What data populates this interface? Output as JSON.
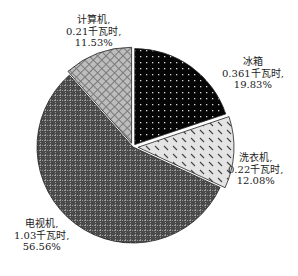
{
  "chart_data": {
    "type": "pie",
    "title": "",
    "unit": "千瓦时",
    "slices": [
      {
        "name": "冰箱",
        "value": 0.361,
        "percent": 19.83,
        "value_label": "0.361千瓦时,",
        "pct_label": "19.83%",
        "name_label": "冰箱"
      },
      {
        "name": "洗衣机",
        "value": 0.22,
        "percent": 12.08,
        "value_label": "0.22千瓦时,",
        "pct_label": "12.08%",
        "name_label": "洗衣机,"
      },
      {
        "name": "电视机",
        "value": 1.03,
        "percent": 56.56,
        "value_label": "1.03千瓦时,",
        "pct_label": "56.56%",
        "name_label": "电视机,"
      },
      {
        "name": "计算机",
        "value": 0.21,
        "percent": 11.53,
        "value_label": "0.21千瓦时,",
        "pct_label": "11.53%",
        "name_label": "计算机,"
      }
    ],
    "legend": "none",
    "exploded": true
  }
}
